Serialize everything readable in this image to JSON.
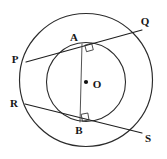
{
  "figure": {
    "canvas": {
      "width": 167,
      "height": 159,
      "background": "#ffffff"
    },
    "colors": {
      "stroke": "#2b2b2b",
      "chord": "#1f1f1f",
      "diameter": "#4a4a4a",
      "label": "#161616",
      "center_dot": "#111111"
    },
    "center": {
      "name": "O",
      "x": 86,
      "y": 82
    },
    "circles": [
      {
        "name": "outer-circle",
        "cx": 86,
        "cy": 80,
        "r": 67
      },
      {
        "name": "inner-circle",
        "cx": 86,
        "cy": 82,
        "r": 40
      }
    ],
    "points": [
      {
        "id": "P",
        "label": "P",
        "x": 26,
        "y": 62,
        "label_x": 15,
        "label_y": 60
      },
      {
        "id": "Q",
        "label": "Q",
        "x": 142,
        "y": 30,
        "label_x": 145,
        "label_y": 22
      },
      {
        "id": "R",
        "label": "R",
        "x": 25,
        "y": 104,
        "label_x": 14,
        "label_y": 104
      },
      {
        "id": "S",
        "label": "S",
        "x": 142,
        "y": 133,
        "label_x": 148,
        "label_y": 139
      },
      {
        "id": "A",
        "label": "A",
        "x": 82,
        "y": 44,
        "label_x": 74,
        "label_y": 38
      },
      {
        "id": "B",
        "label": "B",
        "x": 80,
        "y": 122,
        "label_x": 79,
        "label_y": 131
      },
      {
        "id": "O",
        "label": "O",
        "x": 86,
        "y": 82,
        "label_x": 97,
        "label_y": 85
      }
    ],
    "chords": [
      {
        "name": "chord-PQ",
        "from": "P",
        "to": "Q",
        "x1": 26,
        "y1": 62,
        "x2": 142,
        "y2": 30,
        "tangent_at": "A"
      },
      {
        "name": "chord-RS",
        "from": "R",
        "to": "S",
        "x1": 25,
        "y1": 104,
        "x2": 142,
        "y2": 133,
        "tangent_at": "B"
      }
    ],
    "segments": [
      {
        "name": "segment-AOB",
        "from": "A",
        "to": "B",
        "x1": 82,
        "y1": 44,
        "x2": 80,
        "y2": 122,
        "through": "O"
      }
    ],
    "right_angles": [
      {
        "name": "right-angle-at-A",
        "at": "A",
        "vertex_x": 82,
        "vertex_y": 44,
        "marker": "square",
        "size": 7
      },
      {
        "name": "right-angle-at-B",
        "at": "B",
        "vertex_x": 80,
        "vertex_y": 122,
        "marker": "square",
        "size": 7
      }
    ]
  }
}
